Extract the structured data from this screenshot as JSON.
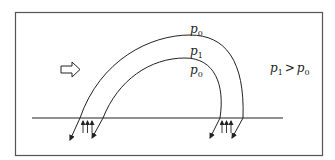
{
  "diagram": {
    "labels": {
      "outer_top": {
        "base": "p",
        "sub": "0"
      },
      "inside": {
        "base": "p",
        "sub": "1"
      },
      "inner_below": {
        "base": "p",
        "sub": "0"
      }
    },
    "relation": {
      "left": {
        "base": "p",
        "sub": "1"
      },
      "op": ">",
      "right": {
        "base": "p",
        "sub": "0"
      }
    },
    "flow_arrow": "hollow-right-arrow",
    "footpoints": [
      {
        "name": "left-footpoint",
        "upflow_arrows": 3,
        "field_arrows_down": 2
      },
      {
        "name": "right-footpoint",
        "upflow_arrows": 3,
        "field_arrows_down": 2
      }
    ],
    "colors": {
      "line": "#222222",
      "frame": "#555555",
      "background": "#ffffff"
    }
  }
}
